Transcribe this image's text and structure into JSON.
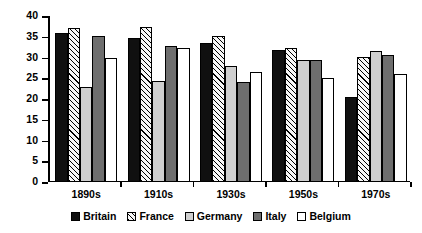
{
  "chart_data": {
    "type": "bar",
    "title": "",
    "xlabel": "",
    "ylabel": "Women as % of labour force",
    "ylim": [
      0,
      40
    ],
    "ytick_step": 5,
    "ytick_labels": [
      "0",
      "5",
      "10",
      "15",
      "20",
      "25",
      "30",
      "35",
      "40"
    ],
    "grid": false,
    "legend_position": "bottom",
    "categories": [
      "1890s",
      "1910s",
      "1930s",
      "1950s",
      "1970s"
    ],
    "series": [
      {
        "name": "Britain",
        "fill": "solid",
        "color": "#101010",
        "values": [
          36.0,
          34.8,
          33.6,
          31.9,
          20.4
        ]
      },
      {
        "name": "France",
        "fill": "hatch",
        "color": "#f7f7f7",
        "values": [
          37.2,
          37.3,
          35.1,
          32.4,
          30.2
        ]
      },
      {
        "name": "Germany",
        "fill": "lightgray",
        "color": "#cfcfcf",
        "values": [
          23.0,
          24.3,
          28.0,
          29.4,
          31.6
        ]
      },
      {
        "name": "Italy",
        "fill": "darkgray",
        "color": "#6e6e6e",
        "values": [
          35.2,
          32.8,
          24.1,
          29.5,
          30.5
        ]
      },
      {
        "name": "Belgium",
        "fill": "white",
        "color": "#ffffff",
        "values": [
          29.9,
          32.4,
          26.6,
          25.0,
          26.0
        ]
      }
    ]
  }
}
